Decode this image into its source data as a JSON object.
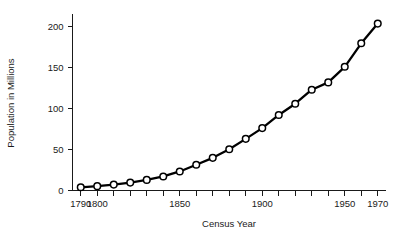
{
  "chart_data": {
    "type": "line",
    "title": "",
    "xlabel": "Census Year",
    "ylabel": "Population in Millions",
    "xlim": [
      1785,
      1975
    ],
    "ylim": [
      0,
      215
    ],
    "grid": false,
    "legend": "none",
    "marker": "open-circle",
    "x": [
      1790,
      1800,
      1810,
      1820,
      1830,
      1840,
      1850,
      1860,
      1870,
      1880,
      1890,
      1900,
      1910,
      1920,
      1930,
      1940,
      1950,
      1960,
      1970
    ],
    "values": [
      3.9,
      5.3,
      7.2,
      9.6,
      12.9,
      17.1,
      23.2,
      31.4,
      39.8,
      50.2,
      62.9,
      76.0,
      92.0,
      105.7,
      122.8,
      131.7,
      150.7,
      179.3,
      203.3
    ],
    "series": [
      {
        "name": "Population",
        "values": [
          3.9,
          5.3,
          7.2,
          9.6,
          12.9,
          17.1,
          23.2,
          31.4,
          39.8,
          50.2,
          62.9,
          76.0,
          92.0,
          105.7,
          122.8,
          131.7,
          150.7,
          179.3,
          203.3
        ]
      }
    ],
    "x_ticks_all": [
      1790,
      1800,
      1810,
      1820,
      1830,
      1840,
      1850,
      1860,
      1870,
      1880,
      1890,
      1900,
      1910,
      1920,
      1930,
      1940,
      1950,
      1960,
      1970
    ],
    "x_tick_labels": [
      {
        "value": 1790,
        "label": "1790"
      },
      {
        "value": 1800,
        "label": "1800"
      },
      {
        "value": 1850,
        "label": "1850"
      },
      {
        "value": 1900,
        "label": "1900"
      },
      {
        "value": 1950,
        "label": "1950"
      },
      {
        "value": 1970,
        "label": "1970"
      }
    ],
    "y_ticks": [
      {
        "value": 0,
        "label": "0"
      },
      {
        "value": 50,
        "label": "50"
      },
      {
        "value": 100,
        "label": "100"
      },
      {
        "value": 150,
        "label": "150"
      },
      {
        "value": 200,
        "label": "200"
      }
    ],
    "colors": {
      "line": "#000000",
      "marker_fill": "#ffffff",
      "marker_stroke": "#000000",
      "axis": "#1a1a1a",
      "background": "#ffffff"
    }
  }
}
